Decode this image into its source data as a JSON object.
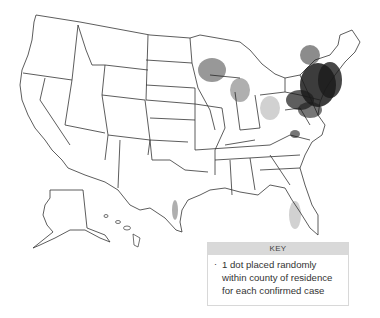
{
  "map": {
    "title": "United States dot density map of confirmed cases",
    "colors": {
      "border": "#333333",
      "dot": "#1a1a1a",
      "key_header_bg": "#d9d9d9"
    }
  },
  "key": {
    "header": "KEY",
    "bullet": "·",
    "line1": "1 dot placed randomly",
    "line2": "within county of residence",
    "line3": "for each confirmed case"
  }
}
